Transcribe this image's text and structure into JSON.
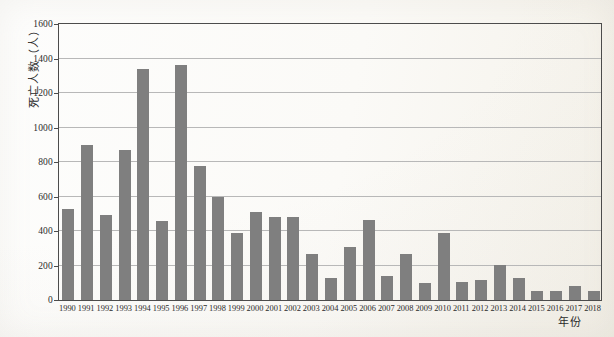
{
  "chart_data": {
    "type": "bar",
    "title": "",
    "xlabel": "年份",
    "ylabel": "死亡人数（人）",
    "categories": [
      "1990",
      "1991",
      "1992",
      "1993",
      "1994",
      "1995",
      "1996",
      "1997",
      "1998",
      "1999",
      "2000",
      "2001",
      "2002",
      "2003",
      "2004",
      "2005",
      "2006",
      "2007",
      "2008",
      "2009",
      "2010",
      "2011",
      "2012",
      "2013",
      "2014",
      "2015",
      "2016",
      "2017",
      "2018"
    ],
    "values": [
      530,
      900,
      490,
      870,
      1340,
      460,
      1365,
      775,
      600,
      390,
      510,
      480,
      480,
      265,
      130,
      305,
      465,
      140,
      265,
      100,
      390,
      105,
      115,
      205,
      125,
      50,
      55,
      80,
      50
    ],
    "ylim": [
      0,
      1600
    ],
    "yticks": [
      0,
      200,
      400,
      600,
      800,
      1000,
      1200,
      1400,
      1600
    ],
    "grid": "horizontal",
    "legend": "none",
    "colors": {
      "bar": "#7f7f7f",
      "gridline": "#b8b8b8",
      "axis": "#4c4c4c",
      "text": "#2b2b2b"
    }
  }
}
